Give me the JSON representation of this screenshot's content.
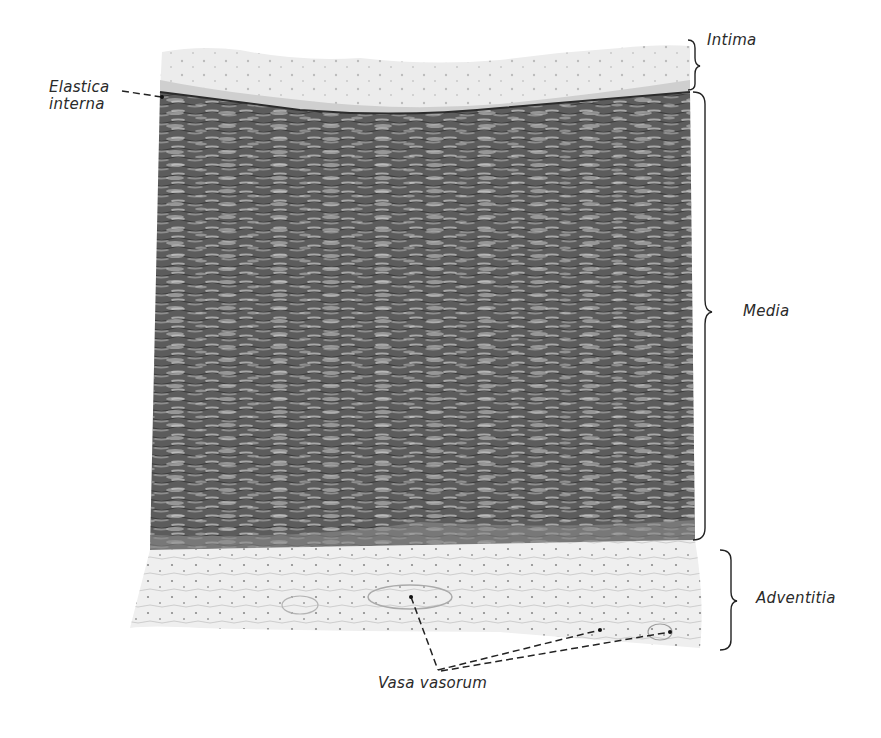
{
  "figure": {
    "labels": {
      "intima": "Intima",
      "media": "Media",
      "adventitia": "Adventitia",
      "elastica_line1": "Elastica",
      "elastica_line2": "interna",
      "vasa_vasorum": "Vasa vasorum"
    },
    "layers": [
      {
        "name": "Intima",
        "tone": "#e6e6e6"
      },
      {
        "name": "Media",
        "tone": "#6a6a6a"
      },
      {
        "name": "Adventitia",
        "tone": "#e9e9e9"
      }
    ],
    "colors": {
      "background": "#ffffff",
      "ink": "#222222",
      "media_dark": "#4f4f4f",
      "media_light": "#9a9a9a",
      "intima_light": "#ececec",
      "adventitia_light": "#eeeeee"
    }
  }
}
